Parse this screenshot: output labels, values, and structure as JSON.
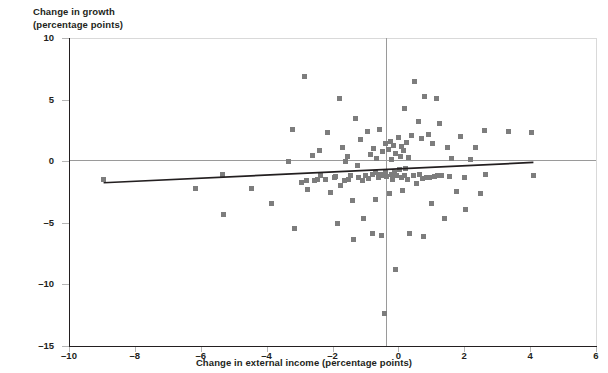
{
  "chart_data": {
    "type": "scatter",
    "title": "",
    "ylabel": "Change in growth\n(percentage points)",
    "xlabel": "Change in external income (percentage points)",
    "xlim": [
      -10,
      6
    ],
    "ylim": [
      -15,
      10
    ],
    "xticks": [
      -10,
      -8,
      -6,
      -4,
      -2,
      0,
      2,
      4,
      6
    ],
    "xticklabels": [
      "–10",
      "–8",
      "–6",
      "–4",
      "–2",
      "0",
      "2",
      "4",
      "6"
    ],
    "yticks": [
      10,
      5,
      0,
      -5,
      -10,
      -15
    ],
    "yticklabels": [
      "10",
      "5",
      "0",
      "–5",
      "–10",
      "–15"
    ],
    "grid": false,
    "legend": null,
    "zero_lines": {
      "x": 0,
      "y": 0
    },
    "marker": {
      "shape": "square",
      "color": "#7d7d7d",
      "size": 5
    },
    "trendline": {
      "color": "#231f20",
      "x_start": -8.95,
      "y_start": -1.75,
      "x_end": 4.1,
      "y_end": -0.1,
      "slope": 0.126,
      "intercept": -0.62
    },
    "points": [
      [
        -8.95,
        -1.45
      ],
      [
        -6.15,
        -2.2
      ],
      [
        -5.35,
        -1.05
      ],
      [
        -5.3,
        -4.3
      ],
      [
        -4.45,
        -2.25
      ],
      [
        -3.85,
        -3.4
      ],
      [
        -3.35,
        -0.05
      ],
      [
        -3.2,
        2.55
      ],
      [
        -3.15,
        -5.5
      ],
      [
        -2.95,
        -1.7
      ],
      [
        -2.85,
        6.85
      ],
      [
        -2.8,
        -1.55
      ],
      [
        -2.75,
        -2.3
      ],
      [
        -2.6,
        0.45
      ],
      [
        -2.55,
        -1.6
      ],
      [
        -2.45,
        -1.45
      ],
      [
        -2.4,
        0.9
      ],
      [
        -2.35,
        -1.2
      ],
      [
        -2.2,
        -1.5
      ],
      [
        -2.15,
        2.35
      ],
      [
        -2.05,
        -2.5
      ],
      [
        -1.95,
        -1.35
      ],
      [
        -1.9,
        -1.25
      ],
      [
        -1.85,
        -5.05
      ],
      [
        -1.8,
        5.1
      ],
      [
        -1.75,
        -2.0
      ],
      [
        -1.7,
        1.15
      ],
      [
        -1.65,
        -1.6
      ],
      [
        -1.6,
        -0.05
      ],
      [
        -1.55,
        0.35
      ],
      [
        -1.5,
        -1.45
      ],
      [
        -1.45,
        -1.2
      ],
      [
        -1.4,
        -3.2
      ],
      [
        -1.35,
        -6.35
      ],
      [
        -1.3,
        3.5
      ],
      [
        -1.25,
        -0.35
      ],
      [
        -1.2,
        -1.35
      ],
      [
        -1.15,
        1.75
      ],
      [
        -1.1,
        -1.55
      ],
      [
        -1.05,
        -4.65
      ],
      [
        -1.0,
        -1.2
      ],
      [
        -0.95,
        2.4
      ],
      [
        -0.9,
        -1.4
      ],
      [
        -0.85,
        0.55
      ],
      [
        -0.8,
        -1.1
      ],
      [
        -0.78,
        -5.9
      ],
      [
        -0.75,
        1.05
      ],
      [
        -0.7,
        -0.95
      ],
      [
        -0.68,
        -3.1
      ],
      [
        -0.65,
        0.2
      ],
      [
        -0.6,
        -1.3
      ],
      [
        -0.58,
        2.6
      ],
      [
        -0.55,
        -1.05
      ],
      [
        -0.5,
        -6.0
      ],
      [
        -0.48,
        0.75
      ],
      [
        -0.45,
        -1.15
      ],
      [
        -0.42,
        -12.4
      ],
      [
        -0.4,
        1.45
      ],
      [
        -0.38,
        -0.8
      ],
      [
        -0.35,
        -1.25
      ],
      [
        -0.3,
        0.95
      ],
      [
        -0.28,
        -2.6
      ],
      [
        -0.25,
        1.6
      ],
      [
        -0.22,
        -1.1
      ],
      [
        -0.2,
        0.15
      ],
      [
        -0.18,
        -1.45
      ],
      [
        -0.15,
        1.3
      ],
      [
        -0.12,
        -0.9
      ],
      [
        -0.1,
        -8.8
      ],
      [
        -0.08,
        0.65
      ],
      [
        -0.05,
        -1.2
      ],
      [
        0.0,
        1.95
      ],
      [
        0.02,
        -0.7
      ],
      [
        0.05,
        0.4
      ],
      [
        0.08,
        -1.35
      ],
      [
        0.1,
        1.2
      ],
      [
        0.12,
        -2.35
      ],
      [
        0.15,
        0.85
      ],
      [
        0.18,
        -1.15
      ],
      [
        0.2,
        4.3
      ],
      [
        0.22,
        -0.6
      ],
      [
        0.25,
        1.55
      ],
      [
        0.28,
        -1.5
      ],
      [
        0.3,
        0.3
      ],
      [
        0.35,
        -5.9
      ],
      [
        0.4,
        2.05
      ],
      [
        0.45,
        -1.2
      ],
      [
        0.5,
        6.45
      ],
      [
        0.55,
        -1.85
      ],
      [
        0.6,
        3.25
      ],
      [
        0.65,
        -1.05
      ],
      [
        0.7,
        1.85
      ],
      [
        0.72,
        -1.4
      ],
      [
        0.75,
        -6.1
      ],
      [
        0.8,
        5.25
      ],
      [
        0.85,
        -1.35
      ],
      [
        0.9,
        2.15
      ],
      [
        0.95,
        -1.3
      ],
      [
        1.0,
        -3.45
      ],
      [
        1.05,
        1.4
      ],
      [
        1.1,
        -1.25
      ],
      [
        1.15,
        5.1
      ],
      [
        1.2,
        -1.2
      ],
      [
        1.25,
        3.05
      ],
      [
        1.3,
        -1.15
      ],
      [
        1.4,
        -4.65
      ],
      [
        1.5,
        1.1
      ],
      [
        1.55,
        -1.25
      ],
      [
        1.6,
        0.2
      ],
      [
        1.75,
        -2.45
      ],
      [
        1.9,
        2.0
      ],
      [
        2.0,
        -1.3
      ],
      [
        2.05,
        -3.95
      ],
      [
        2.2,
        0.1
      ],
      [
        2.35,
        1.15
      ],
      [
        2.5,
        -2.6
      ],
      [
        2.6,
        2.5
      ],
      [
        2.65,
        -1.1
      ],
      [
        3.35,
        2.45
      ],
      [
        4.05,
        2.35
      ],
      [
        4.1,
        -1.15
      ]
    ]
  }
}
